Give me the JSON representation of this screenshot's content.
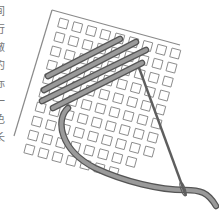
{
  "illustration": {
    "subject": "needlepoint canvas with needle and thread",
    "colors": {
      "canvas_outline": "#888888",
      "grid_square": "#8a8a8a",
      "thread_fill": "#8c8c8c",
      "thread_stroke": "#555555",
      "needle": "#6f6f6f",
      "background": "#ffffff"
    }
  },
  "side_text": {
    "chars": [
      "间",
      "行",
      "做",
      "的",
      "标",
      "一",
      "色",
      "长"
    ]
  }
}
